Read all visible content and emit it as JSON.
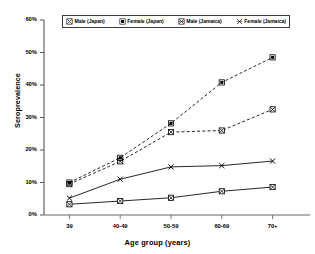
{
  "chart_data": {
    "type": "line",
    "title": "",
    "xlabel": "Age group (years)",
    "ylabel": "Seroprevalence",
    "categories": [
      "39",
      "40-49",
      "50-59",
      "60-69",
      "70+"
    ],
    "ylim": [
      0,
      60
    ],
    "ytick_labels": [
      "0%",
      "10%",
      "20%",
      "30%",
      "40%",
      "50%",
      "60%"
    ],
    "ytick_values": [
      0,
      10,
      20,
      30,
      40,
      50,
      60
    ],
    "grid": false,
    "legend_position": "top",
    "series": [
      {
        "name": "Male (Japan)",
        "marker": "x-box",
        "linestyle": "dashed",
        "color": "#000000",
        "values": [
          9.5,
          16.5,
          25.5,
          26.0,
          32.5
        ]
      },
      {
        "name": "Female (Japan)",
        "marker": "filled-square",
        "linestyle": "dashed",
        "color": "#000000",
        "values": [
          10.0,
          17.6,
          28.2,
          40.8,
          48.5
        ]
      },
      {
        "name": "Male (Jamaica)",
        "marker": "box-with-x",
        "linestyle": "solid",
        "color": "#000000",
        "values": [
          3.3,
          4.3,
          5.3,
          7.3,
          8.6
        ]
      },
      {
        "name": "Female (Jamaica)",
        "marker": "x",
        "linestyle": "solid",
        "color": "#000000",
        "values": [
          5.2,
          11.0,
          14.8,
          15.2,
          16.6
        ]
      }
    ]
  },
  "legend": {
    "entries": [
      {
        "label": "Male (Japan)"
      },
      {
        "label": "Female (Japan)"
      },
      {
        "label": "Male (Jamaica)"
      },
      {
        "label": "Female (Jamaica)"
      }
    ]
  }
}
